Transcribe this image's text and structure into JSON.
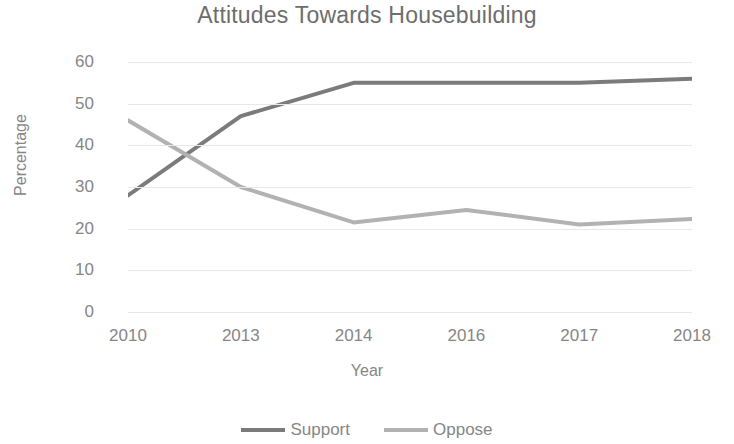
{
  "chart_data": {
    "type": "line",
    "title": "Attitudes Towards Housebuilding",
    "xlabel": "Year",
    "ylabel": "Percentage",
    "categories": [
      "2010",
      "2013",
      "2014",
      "2016",
      "2017",
      "2018"
    ],
    "ylim": [
      0,
      60
    ],
    "yticks": [
      "0",
      "10",
      "20",
      "30",
      "40",
      "50",
      "60"
    ],
    "grid": true,
    "legend_position": "bottom",
    "series": [
      {
        "name": "Support",
        "color": "#7b7b7b",
        "values": [
          28,
          47,
          55,
          55,
          55,
          56
        ]
      },
      {
        "name": "Oppose",
        "color": "#b2b2b2",
        "values": [
          46,
          30,
          21.5,
          24.5,
          21,
          22.3
        ]
      }
    ]
  }
}
